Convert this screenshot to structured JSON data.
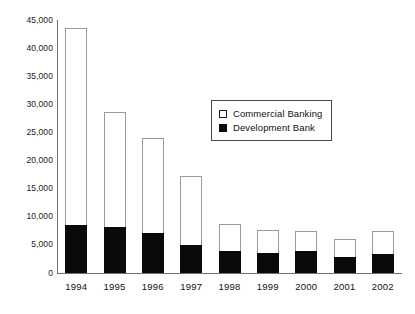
{
  "chart_data": {
    "type": "bar",
    "title": "",
    "subtitle": "",
    "xlabel": "",
    "ylabel": "",
    "stacked": true,
    "grid": false,
    "legend_position": "inside-upper-right",
    "ylim": [
      0,
      45000
    ],
    "ytick_values": [
      0,
      5000,
      10000,
      15000,
      20000,
      25000,
      30000,
      35000,
      40000,
      45000
    ],
    "ytick_labels": [
      "0",
      "5,000",
      "10,000",
      "15,000",
      "20,000",
      "25,000",
      "30,000",
      "35,000",
      "40,000",
      "45,000"
    ],
    "categories": [
      "1994",
      "1995",
      "1996",
      "1997",
      "1998",
      "1999",
      "2000",
      "2001",
      "2002"
    ],
    "series": [
      {
        "name": "Commercial Banking",
        "color": "#ffffff",
        "values": [
          34900,
          20500,
          16800,
          12200,
          4800,
          4200,
          3500,
          3200,
          4000
        ]
      },
      {
        "name": "Development Bank",
        "color": "#0a0a0a",
        "values": [
          8600,
          8200,
          7200,
          5000,
          4000,
          3500,
          4000,
          2800,
          3400
        ]
      }
    ],
    "totals": [
      43500,
      28700,
      24000,
      17200,
      8800,
      7700,
      7500,
      6000,
      7400
    ]
  },
  "legend": {
    "items": [
      {
        "label": "Commercial Banking",
        "swatch": "hollow-square-icon"
      },
      {
        "label": "Development Bank",
        "swatch": "filled-square-icon"
      }
    ]
  }
}
